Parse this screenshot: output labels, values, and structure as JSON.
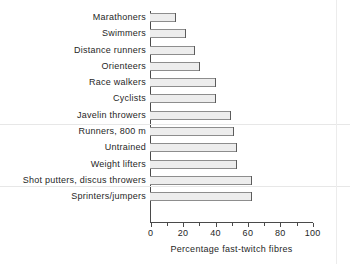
{
  "chart_data": {
    "type": "bar",
    "orientation": "horizontal",
    "title": "",
    "xlabel": "Percentage fast-twitch fibres",
    "ylabel": "",
    "xlim": [
      0,
      100
    ],
    "xticks": [
      0,
      20,
      40,
      60,
      80,
      100
    ],
    "xticklabels": [
      "0",
      "20",
      "40",
      "60",
      "80",
      "100"
    ],
    "grid": false,
    "legend": false,
    "categories": [
      "Marathoners",
      "Swimmers",
      "Distance runners",
      "Orienteers",
      "Race walkers",
      "Cyclists",
      "Javelin throwers",
      "Runners, 800 m",
      "Untrained",
      "Weight lifters",
      "Shot putters, discus throwers",
      "Sprinters/jumpers"
    ],
    "values": [
      16,
      22,
      28,
      31,
      41,
      41,
      50,
      52,
      54,
      54,
      63,
      63
    ],
    "bar_fill_color": "#ededed",
    "bar_edge_color": "#5c5c5c",
    "axis_color": "#4a4a4a",
    "background_color": "#ffffff"
  },
  "artifacts": {
    "scanlines_y": [
      124,
      186
    ],
    "scanline_x": 336
  }
}
